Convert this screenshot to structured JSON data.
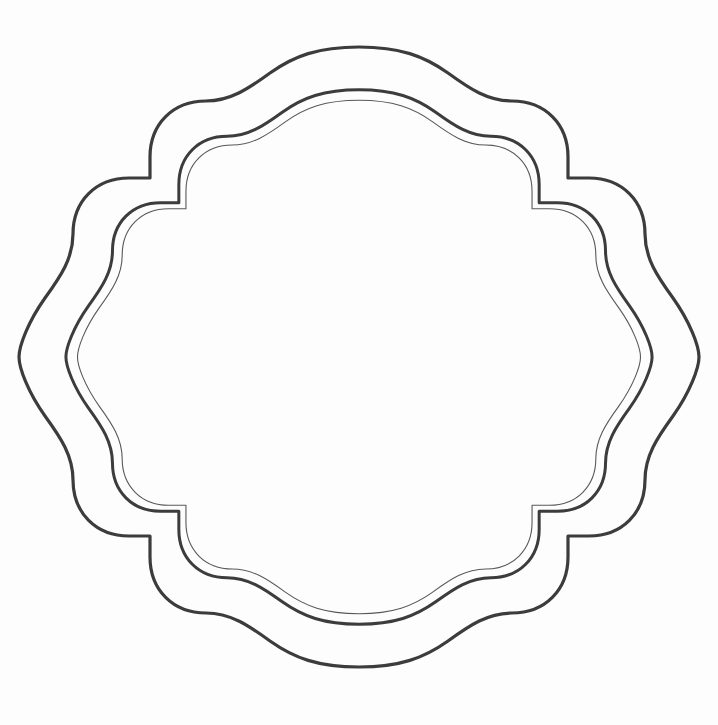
{
  "document": {
    "title": "Ornamental Scalloped Frame Outline",
    "type": "vector-line-art",
    "canvas_width": 718,
    "canvas_height": 725,
    "background_color": "#fdfdfd",
    "line_color": "#3c3c3c",
    "inner_line_color": "#555555",
    "description": "Decorative quatrefoil-style label frame consisting of three nested scalloped outlines with stepped corner notches. No text content is present."
  },
  "artwork": {
    "shape_name": "scalloped-ornamental-frame",
    "outline_count": 3,
    "outlines": [
      {
        "id": "outer",
        "name": "outer-frame-outline",
        "stroke_width": 3.2,
        "stroke_color": "#3c3c3c",
        "scale": 1.0,
        "bounds": {
          "left": 42,
          "top": 47,
          "right": 676,
          "bottom": 667
        }
      },
      {
        "id": "middle",
        "name": "middle-frame-outline",
        "stroke_width": 3.0,
        "stroke_color": "#3c3c3c",
        "scale": 0.862,
        "bounds": {
          "left": 85,
          "top": 76,
          "right": 632,
          "bottom": 648
        }
      },
      {
        "id": "inner",
        "name": "inner-frame-outline",
        "stroke_width": 1.1,
        "stroke_color": "#585858",
        "scale": 0.828,
        "bounds": {
          "left": 96,
          "top": 85,
          "right": 621,
          "bottom": 640
        }
      }
    ],
    "geometry": {
      "center_x": 359,
      "center_y": 357,
      "corner_notch": {
        "present": true,
        "count": 4,
        "description": "stepped right-angle notch at each of the four diagonal corners"
      },
      "edge_style": "double-lobed scallop on each of the four cardinal edges",
      "side_bulge_style": "large convex arc on left and right flanks"
    }
  },
  "viewer": {
    "zoom_level": "100%",
    "fit_mode": "fit-to-page"
  }
}
